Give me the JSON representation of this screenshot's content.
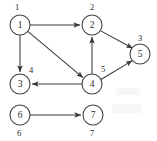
{
  "figure": {
    "type": "directed-graph",
    "background_color": "#ffffff",
    "node_stroke_color": "#444444",
    "edge_color": "#3a3a3a",
    "text_color": "#2b2b2b"
  },
  "nodes": [
    {
      "id": "n1",
      "name": "node-1",
      "value": "1",
      "external_label": "1",
      "label_position": "above",
      "cx": 20,
      "cy": 25,
      "r": 10
    },
    {
      "id": "n2",
      "name": "node-2",
      "value": "2",
      "external_label": "2",
      "label_position": "above",
      "cx": 92,
      "cy": 25,
      "r": 10
    },
    {
      "id": "n5",
      "name": "node-5",
      "value": "5",
      "external_label": "3",
      "label_position": "above-right",
      "cx": 140,
      "cy": 54,
      "r": 10
    },
    {
      "id": "n3",
      "name": "node-3",
      "value": "3",
      "external_label": "4",
      "label_position": "above-right",
      "cx": 20,
      "cy": 84,
      "r": 10
    },
    {
      "id": "n4",
      "name": "node-4",
      "value": "4",
      "external_label": "5",
      "label_position": "above-right",
      "cx": 92,
      "cy": 84,
      "r": 10
    },
    {
      "id": "n6",
      "name": "node-6",
      "value": "6",
      "external_label": "6",
      "label_position": "below",
      "cx": 20,
      "cy": 115,
      "r": 10
    },
    {
      "id": "n7",
      "name": "node-7",
      "value": "7",
      "external_label": "7",
      "label_position": "below",
      "cx": 93,
      "cy": 115,
      "r": 10
    }
  ],
  "edges": [
    {
      "name": "edge-1-to-2",
      "from": "n1",
      "to": "n2",
      "directed": true
    },
    {
      "name": "edge-1-to-3",
      "from": "n1",
      "to": "n3",
      "directed": true
    },
    {
      "name": "edge-1-to-4",
      "from": "n1",
      "to": "n4",
      "directed": true
    },
    {
      "name": "edge-4-to-2",
      "from": "n4",
      "to": "n2",
      "directed": true
    },
    {
      "name": "edge-2-to-5",
      "from": "n2",
      "to": "n5",
      "directed": true
    },
    {
      "name": "edge-4-to-5",
      "from": "n4",
      "to": "n5",
      "directed": true
    },
    {
      "name": "edge-4-to-3",
      "from": "n4",
      "to": "n3",
      "directed": true
    },
    {
      "name": "edge-6-to-7",
      "from": "n6",
      "to": "n7",
      "directed": true
    }
  ]
}
